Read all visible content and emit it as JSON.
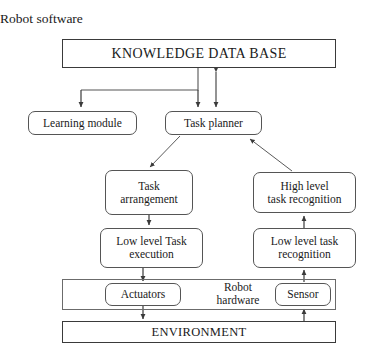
{
  "diagram": {
    "title": "Robot software",
    "caption_hardware": "Robot\nhardware",
    "nodes": {
      "knowledge_data_base": "KNOWLEDGE DATA BASE",
      "learning_module": "Learning module",
      "task_planner": "Task planner",
      "task_arrangement": "Task\narrangement",
      "high_level_task_recognition": "High level\ntask recognition",
      "low_level_task_execution": "Low level Task\nexecution",
      "low_level_task_recognition": "Low level task\nrecognition",
      "actuators": "Actuators",
      "sensor": "Sensor",
      "environment": "ENVIRONMENT"
    },
    "colors": {
      "background": "#ffffff",
      "text": "#1a1a1a",
      "box_border": "#4a4a4a",
      "container_border": "#6b6b6b",
      "connector": "#4a4a4a"
    },
    "connectors": [
      {
        "name": "kdb-to-learning-module",
        "from": "knowledge_data_base",
        "to": "learning_module",
        "style": "elbow-arrow"
      },
      {
        "name": "kdb-to-task-planner-branch",
        "from": "knowledge_data_base",
        "to": "task_planner",
        "style": "elbow-arrow"
      },
      {
        "name": "kdb-task-planner-bidirectional",
        "from": "knowledge_data_base",
        "to": "task_planner",
        "style": "double-arrow"
      },
      {
        "name": "task-planner-to-task-arrangement",
        "from": "task_planner",
        "to": "task_arrangement",
        "style": "diagonal-arrow"
      },
      {
        "name": "high-level-recognition-to-task-planner",
        "from": "high_level_task_recognition",
        "to": "task_planner",
        "style": "diagonal-arrow"
      },
      {
        "name": "task-arrangement-to-low-level-execution",
        "from": "task_arrangement",
        "to": "low_level_task_execution",
        "style": "arrow"
      },
      {
        "name": "low-level-recognition-to-high-level-recognition",
        "from": "low_level_task_recognition",
        "to": "high_level_task_recognition",
        "style": "arrow"
      },
      {
        "name": "low-level-execution-to-actuators",
        "from": "low_level_task_execution",
        "to": "actuators",
        "style": "arrow"
      },
      {
        "name": "sensor-to-low-level-recognition",
        "from": "sensor",
        "to": "low_level_task_recognition",
        "style": "arrow"
      },
      {
        "name": "actuators-to-environment",
        "from": "actuators",
        "to": "environment",
        "style": "arrow"
      },
      {
        "name": "environment-to-sensor",
        "from": "environment",
        "to": "sensor",
        "style": "arrow"
      }
    ]
  }
}
